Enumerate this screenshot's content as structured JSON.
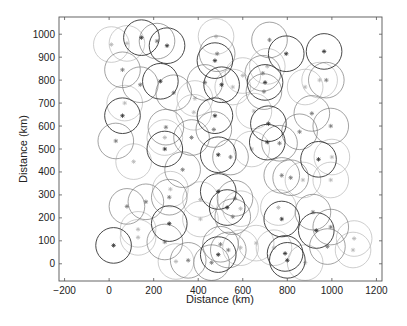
{
  "chart_data": {
    "type": "scatter",
    "title": "",
    "xlabel": "Distance (km)",
    "ylabel": "Distance (km)",
    "xlim": [
      -225,
      1225
    ],
    "ylim": [
      -75,
      1075
    ],
    "xticks": [
      -200,
      0,
      200,
      400,
      600,
      800,
      1000,
      1200
    ],
    "yticks": [
      0,
      100,
      200,
      300,
      400,
      500,
      600,
      700,
      800,
      900,
      1000
    ],
    "grid": false,
    "legend": null,
    "marker": "asterisk",
    "circle_radius_km": 80,
    "colors": {
      "dark": "#333333",
      "medium": "#7a7a7a",
      "light": "#b8b8b8"
    },
    "points": [
      {
        "x": 145,
        "y": 985,
        "shade": "dark"
      },
      {
        "x": 215,
        "y": 970,
        "shade": "medium"
      },
      {
        "x": 260,
        "y": 950,
        "shade": "dark"
      },
      {
        "x": 10,
        "y": 955,
        "shade": "light"
      },
      {
        "x": 80,
        "y": 960,
        "shade": "light"
      },
      {
        "x": 60,
        "y": 845,
        "shade": "medium"
      },
      {
        "x": 140,
        "y": 780,
        "shade": "medium"
      },
      {
        "x": 230,
        "y": 795,
        "shade": "dark"
      },
      {
        "x": 290,
        "y": 745,
        "shade": "medium"
      },
      {
        "x": 70,
        "y": 700,
        "shade": "light"
      },
      {
        "x": 60,
        "y": 645,
        "shade": "dark"
      },
      {
        "x": 30,
        "y": 535,
        "shade": "medium"
      },
      {
        "x": 110,
        "y": 445,
        "shade": "light"
      },
      {
        "x": 255,
        "y": 595,
        "shade": "medium"
      },
      {
        "x": 250,
        "y": 550,
        "shade": "light"
      },
      {
        "x": 250,
        "y": 500,
        "shade": "dark"
      },
      {
        "x": 370,
        "y": 550,
        "shade": "medium"
      },
      {
        "x": 380,
        "y": 660,
        "shade": "light"
      },
      {
        "x": 330,
        "y": 410,
        "shade": "medium"
      },
      {
        "x": 480,
        "y": 990,
        "shade": "light"
      },
      {
        "x": 485,
        "y": 915,
        "shade": "medium"
      },
      {
        "x": 475,
        "y": 885,
        "shade": "dark"
      },
      {
        "x": 430,
        "y": 790,
        "shade": "medium"
      },
      {
        "x": 505,
        "y": 780,
        "shade": "dark"
      },
      {
        "x": 475,
        "y": 645,
        "shade": "dark"
      },
      {
        "x": 470,
        "y": 585,
        "shade": "medium"
      },
      {
        "x": 490,
        "y": 475,
        "shade": "dark"
      },
      {
        "x": 545,
        "y": 465,
        "shade": "medium"
      },
      {
        "x": 600,
        "y": 820,
        "shade": "light"
      },
      {
        "x": 650,
        "y": 665,
        "shade": "light"
      },
      {
        "x": 720,
        "y": 975,
        "shade": "medium"
      },
      {
        "x": 795,
        "y": 915,
        "shade": "dark"
      },
      {
        "x": 965,
        "y": 925,
        "shade": "dark"
      },
      {
        "x": 690,
        "y": 830,
        "shade": "medium"
      },
      {
        "x": 700,
        "y": 790,
        "shade": "dark"
      },
      {
        "x": 695,
        "y": 750,
        "shade": "medium"
      },
      {
        "x": 710,
        "y": 860,
        "shade": "light"
      },
      {
        "x": 880,
        "y": 770,
        "shade": "light"
      },
      {
        "x": 945,
        "y": 800,
        "shade": "light"
      },
      {
        "x": 975,
        "y": 800,
        "shade": "medium"
      },
      {
        "x": 715,
        "y": 610,
        "shade": "dark"
      },
      {
        "x": 710,
        "y": 530,
        "shade": "dark"
      },
      {
        "x": 765,
        "y": 525,
        "shade": "medium"
      },
      {
        "x": 855,
        "y": 575,
        "shade": "medium"
      },
      {
        "x": 910,
        "y": 655,
        "shade": "medium"
      },
      {
        "x": 995,
        "y": 600,
        "shade": "medium"
      },
      {
        "x": 940,
        "y": 455,
        "shade": "dark"
      },
      {
        "x": 1000,
        "y": 465,
        "shade": "light"
      },
      {
        "x": 775,
        "y": 385,
        "shade": "medium"
      },
      {
        "x": 815,
        "y": 375,
        "shade": "medium"
      },
      {
        "x": 870,
        "y": 365,
        "shade": "light"
      },
      {
        "x": 995,
        "y": 365,
        "shade": "light"
      },
      {
        "x": 80,
        "y": 250,
        "shade": "medium"
      },
      {
        "x": 165,
        "y": 270,
        "shade": "medium"
      },
      {
        "x": 270,
        "y": 290,
        "shade": "medium"
      },
      {
        "x": 275,
        "y": 325,
        "shade": "light"
      },
      {
        "x": 270,
        "y": 175,
        "shade": "dark"
      },
      {
        "x": 130,
        "y": 150,
        "shade": "light"
      },
      {
        "x": 130,
        "y": 115,
        "shade": "light"
      },
      {
        "x": 20,
        "y": 80,
        "shade": "dark"
      },
      {
        "x": 250,
        "y": 95,
        "shade": "medium"
      },
      {
        "x": 300,
        "y": 10,
        "shade": "light"
      },
      {
        "x": 355,
        "y": 15,
        "shade": "medium"
      },
      {
        "x": 410,
        "y": 195,
        "shade": "light"
      },
      {
        "x": 410,
        "y": 280,
        "shade": "light"
      },
      {
        "x": 490,
        "y": 315,
        "shade": "dark"
      },
      {
        "x": 530,
        "y": 245,
        "shade": "dark"
      },
      {
        "x": 565,
        "y": 285,
        "shade": "medium"
      },
      {
        "x": 555,
        "y": 205,
        "shade": "medium"
      },
      {
        "x": 590,
        "y": 240,
        "shade": "light"
      },
      {
        "x": 500,
        "y": 85,
        "shade": "medium"
      },
      {
        "x": 490,
        "y": 40,
        "shade": "dark"
      },
      {
        "x": 535,
        "y": 60,
        "shade": "medium"
      },
      {
        "x": 460,
        "y": 5,
        "shade": "medium"
      },
      {
        "x": 590,
        "y": 70,
        "shade": "light"
      },
      {
        "x": 775,
        "y": 195,
        "shade": "dark"
      },
      {
        "x": 760,
        "y": 245,
        "shade": "light"
      },
      {
        "x": 915,
        "y": 225,
        "shade": "medium"
      },
      {
        "x": 930,
        "y": 145,
        "shade": "dark"
      },
      {
        "x": 995,
        "y": 160,
        "shade": "medium"
      },
      {
        "x": 980,
        "y": 75,
        "shade": "medium"
      },
      {
        "x": 790,
        "y": 45,
        "shade": "dark"
      },
      {
        "x": 800,
        "y": 15,
        "shade": "dark"
      },
      {
        "x": 740,
        "y": 70,
        "shade": "light"
      },
      {
        "x": 880,
        "y": 5,
        "shade": "light"
      },
      {
        "x": 1100,
        "y": 110,
        "shade": "light"
      },
      {
        "x": 1095,
        "y": 60,
        "shade": "light"
      },
      {
        "x": 660,
        "y": 90,
        "shade": "light"
      },
      {
        "x": 385,
        "y": 720,
        "shade": "light"
      },
      {
        "x": 555,
        "y": 770,
        "shade": "light"
      },
      {
        "x": 640,
        "y": 500,
        "shade": "light"
      }
    ]
  }
}
